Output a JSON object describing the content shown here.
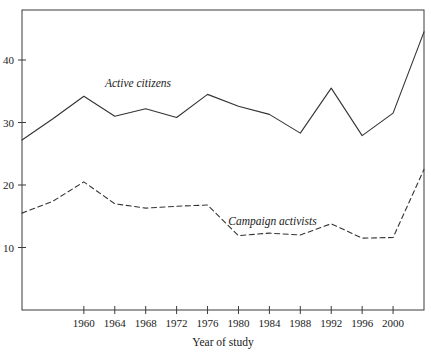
{
  "chart_data": {
    "type": "line",
    "title": "",
    "xlabel": "Year of study",
    "ylabel": "",
    "xlim": [
      1952,
      2004
    ],
    "ylim": [
      0,
      48
    ],
    "grid": false,
    "legend_position": "inline-annotations",
    "xticks": [
      "1960",
      "1964",
      "1968",
      "1972",
      "1976",
      "1980",
      "1984",
      "1988",
      "1992",
      "1996",
      "2000"
    ],
    "xtick_values": [
      1960,
      1964,
      1968,
      1972,
      1976,
      1980,
      1984,
      1988,
      1992,
      1996,
      2000
    ],
    "yticks": [
      "10",
      "20",
      "30",
      "40"
    ],
    "ytick_values": [
      10,
      20,
      30,
      40
    ],
    "x": [
      1952,
      1956,
      1960,
      1964,
      1968,
      1972,
      1976,
      1980,
      1984,
      1988,
      1992,
      1996,
      2000,
      2004
    ],
    "series": [
      {
        "name": "Active citizens",
        "style": "solid",
        "color": "#333333",
        "values": [
          27.2,
          30.6,
          34.2,
          31.0,
          32.2,
          30.8,
          34.5,
          32.6,
          31.3,
          28.3,
          35.5,
          27.9,
          31.5,
          44.5
        ],
        "label_x": 1967.0,
        "label_y": 36.4
      },
      {
        "name": "Campaign activists",
        "style": "dashed",
        "color": "#333333",
        "values": [
          15.5,
          17.4,
          20.5,
          17.0,
          16.3,
          16.6,
          16.8,
          11.9,
          12.3,
          12.0,
          13.8,
          11.5,
          11.6,
          22.5
        ],
        "label_x": 1984.4,
        "label_y": 14.2
      }
    ],
    "annotations": [
      {
        "text": "Active citizens",
        "x": 1967.0,
        "y": 36.4
      },
      {
        "text": "Campaign activists",
        "x": 1984.4,
        "y": 14.2
      }
    ]
  },
  "axes": {
    "x_axis_title": "Year of study"
  }
}
